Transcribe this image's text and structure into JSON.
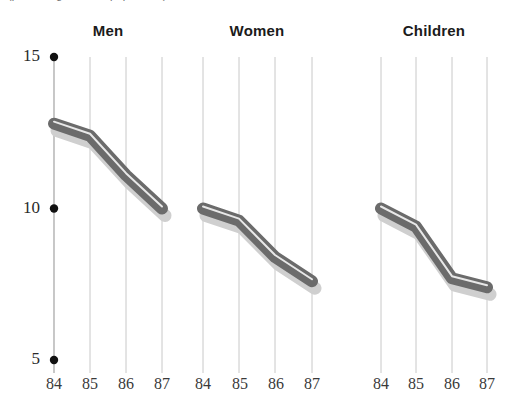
{
  "figure": {
    "clipped_top_caption": "(percentage of total population)",
    "background_color": "#ffffff",
    "line_color": "#6b6b6b",
    "line_highlight_color": "#e8e8e8",
    "shadow_color": "#cfcfcf",
    "gridline_color": "#c8c8c8",
    "axis_color": "#b0b0b0",
    "tick_dot_color": "#111111",
    "title_color": "#1b1b1b"
  },
  "chart_data": {
    "type": "line",
    "title": "",
    "subtitle": "",
    "xlabel": "",
    "ylabel": "",
    "ylim": [
      5,
      15
    ],
    "yticks": [
      5,
      10,
      15
    ],
    "ytick_labels": [
      "5",
      "10",
      "15"
    ],
    "x": [
      84,
      85,
      86,
      87
    ],
    "xtick_labels": [
      "84",
      "85",
      "86",
      "87"
    ],
    "grid": true,
    "grid_orientation": "vertical",
    "legend_position": "none",
    "panels": [
      {
        "name": "Men",
        "label": "Men",
        "categories": [
          "84",
          "85",
          "86",
          "87"
        ],
        "values": [
          12.8,
          12.4,
          11.1,
          10.0
        ]
      },
      {
        "name": "Women",
        "label": "Women",
        "categories": [
          "84",
          "85",
          "86",
          "87"
        ],
        "values": [
          10.0,
          9.6,
          8.4,
          7.6
        ]
      },
      {
        "name": "Children",
        "label": "Children",
        "categories": [
          "84",
          "85",
          "86",
          "87"
        ],
        "values": [
          10.0,
          9.4,
          7.7,
          7.4
        ]
      }
    ]
  },
  "axis": {
    "y_tick_labels": [
      "15",
      "10",
      "5"
    ],
    "x_tick_labels_men": [
      "84",
      "85",
      "86",
      "87"
    ],
    "x_tick_labels_women": [
      "84",
      "85",
      "86",
      "87"
    ],
    "x_tick_labels_children": [
      "84",
      "85",
      "86",
      "87"
    ]
  }
}
